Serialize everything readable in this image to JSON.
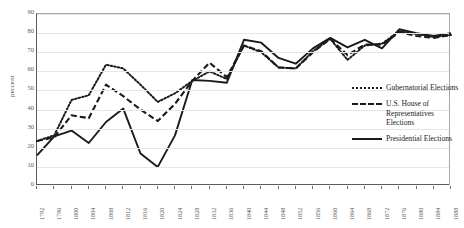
{
  "chart_data": {
    "type": "line",
    "title": "",
    "xlabel": "",
    "ylabel": "percent",
    "ylim": [
      0,
      90
    ],
    "ytick_step": 10,
    "grid": true,
    "legend_position": "right",
    "categories": [
      "1792",
      "1796",
      "1800",
      "1804",
      "1808",
      "1812",
      "1816",
      "1820",
      "1824",
      "1828",
      "1832",
      "1836",
      "1840",
      "1844",
      "1848",
      "1852",
      "1856",
      "1860",
      "1864",
      "1868",
      "1872",
      "1876",
      "1880",
      "1884",
      "1888"
    ],
    "series": [
      {
        "name": "Gubernatorial Elections",
        "style": "dotted",
        "color": "#1a1a1a",
        "values": [
          23.5,
          26.5,
          45.0,
          47.5,
          63.5,
          61.5,
          53.0,
          44.0,
          48.5,
          55.0,
          60.0,
          56.0,
          73.5,
          70.0,
          62.0,
          61.5,
          70.5,
          77.0,
          66.0,
          73.5,
          74.5,
          81.0,
          79.5,
          78.0,
          79.0
        ]
      },
      {
        "name": "U.S. House of Representatives Elections",
        "style": "dashed",
        "color": "#1a1a1a",
        "values": [
          23.5,
          25.5,
          37.0,
          35.5,
          53.0,
          47.0,
          40.0,
          34.0,
          43.0,
          55.0,
          64.5,
          57.0,
          73.5,
          70.5,
          62.0,
          61.5,
          70.0,
          77.0,
          68.5,
          74.0,
          74.0,
          80.5,
          78.5,
          77.5,
          79.0
        ]
      },
      {
        "name": "Presidential Elections",
        "style": "solid",
        "color": "#1a1a1a",
        "values": [
          16.0,
          26.0,
          29.0,
          22.5,
          33.5,
          40.5,
          17.0,
          10.0,
          26.5,
          55.5,
          55.0,
          54.0,
          76.5,
          75.0,
          67.0,
          64.0,
          72.0,
          77.5,
          72.5,
          76.5,
          72.0,
          82.0,
          80.0,
          78.5,
          80.0
        ]
      }
    ],
    "yticks": [
      "0",
      "10",
      "20",
      "30",
      "40",
      "50",
      "60",
      "70",
      "80",
      "90"
    ]
  }
}
